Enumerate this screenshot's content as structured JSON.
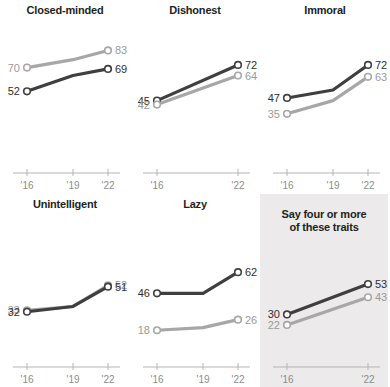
{
  "chart_data": {
    "type": "line",
    "title": "",
    "xlabel": "",
    "ylabel": "",
    "x": [
      "'16",
      "'19",
      "'22"
    ],
    "xlim": [
      2016,
      2022
    ],
    "ylim": [
      0,
      100
    ],
    "grid": false,
    "legend": "none",
    "series_names": [
      "dark",
      "light"
    ],
    "colors": {
      "dark": "#3f3f3f",
      "light": "#a8a6a6",
      "shaded_panel_bg": "#eceaea",
      "axis": "#b5b5b5",
      "tick_text": "#8d8d8d",
      "title_text": "#231f20"
    },
    "panels": [
      {
        "id": "closed-minded",
        "title": "Closed-minded",
        "shaded": false,
        "ticks": [
          "'16",
          "'19",
          "'22"
        ],
        "series": [
          {
            "name": "light",
            "values": [
              70,
              76,
              83
            ],
            "start_label": "70",
            "end_label": "83"
          },
          {
            "name": "dark",
            "values": [
              52,
              64,
              69
            ],
            "start_label": "52",
            "end_label": "69"
          }
        ]
      },
      {
        "id": "dishonest",
        "title": "Dishonest",
        "shaded": false,
        "ticks": [
          "'16",
          "'22"
        ],
        "series": [
          {
            "name": "dark",
            "values": [
              45,
              null,
              72
            ],
            "start_label": "45",
            "end_label": "72"
          },
          {
            "name": "light",
            "values": [
              42,
              null,
              64
            ],
            "start_label": "42",
            "end_label": "64"
          }
        ]
      },
      {
        "id": "immoral",
        "title": "Immoral",
        "shaded": false,
        "ticks": [
          "'16",
          "'19",
          "'22"
        ],
        "series": [
          {
            "name": "dark",
            "values": [
              47,
              53,
              72
            ],
            "start_label": "47",
            "end_label": "72"
          },
          {
            "name": "light",
            "values": [
              35,
              45,
              63
            ],
            "start_label": "35",
            "end_label": "63"
          }
        ]
      },
      {
        "id": "unintelligent",
        "title": "Unintelligent",
        "shaded": false,
        "ticks": [
          "'16",
          "'19",
          "'22"
        ],
        "series": [
          {
            "name": "light",
            "values": [
              33,
              36,
              52
            ],
            "start_label": "33",
            "end_label": "52"
          },
          {
            "name": "dark",
            "values": [
              32,
              36,
              51
            ],
            "start_label": "32",
            "end_label": "51"
          }
        ]
      },
      {
        "id": "lazy",
        "title": "Lazy",
        "shaded": false,
        "ticks": [
          "'16",
          "'19",
          "'22"
        ],
        "series": [
          {
            "name": "dark",
            "values": [
              46,
              46,
              62
            ],
            "start_label": "46",
            "end_label": "62"
          },
          {
            "name": "light",
            "values": [
              18,
              20,
              26
            ],
            "start_label": "18",
            "end_label": "26"
          }
        ]
      },
      {
        "id": "say-four-or-more",
        "title": "Say four or more of these traits",
        "title_lines": [
          "Say four or more",
          "of these traits"
        ],
        "shaded": true,
        "ticks": [
          "'16",
          "'22"
        ],
        "series": [
          {
            "name": "dark",
            "values": [
              30,
              null,
              53
            ],
            "start_label": "30",
            "end_label": "53"
          },
          {
            "name": "light",
            "values": [
              22,
              null,
              43
            ],
            "start_label": "22",
            "end_label": "43"
          }
        ]
      }
    ]
  }
}
